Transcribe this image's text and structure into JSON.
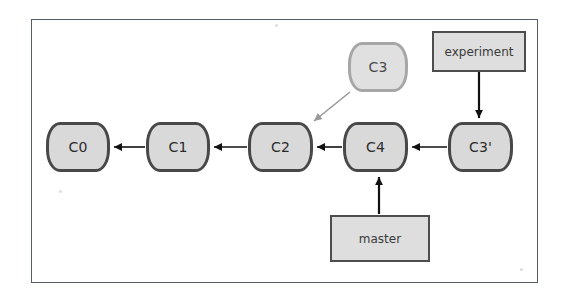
{
  "figure": {
    "frame_color": "#555c63",
    "background": "#ffffff"
  },
  "palette": {
    "node_fill": "#d9d9d9",
    "node_border": "#484848",
    "node_border_faded": "#a6a6a6",
    "label_fill": "#dedede",
    "label_border": "#4d4d4d",
    "arrow_color": "#111111",
    "arrow_color_faded": "#9a9a9a",
    "text_color": "#2b2b2b"
  },
  "commits": [
    {
      "id": "c0",
      "label": "C0",
      "x": 46,
      "y": 122,
      "w": 64,
      "h": 50,
      "faded": false
    },
    {
      "id": "c1",
      "label": "C1",
      "x": 146,
      "y": 122,
      "w": 64,
      "h": 50,
      "faded": false
    },
    {
      "id": "c2",
      "label": "C2",
      "x": 248,
      "y": 122,
      "w": 65,
      "h": 50,
      "faded": false
    },
    {
      "id": "c4",
      "label": "C4",
      "x": 343,
      "y": 122,
      "w": 65,
      "h": 50,
      "faded": false
    },
    {
      "id": "c3p",
      "label": "C3'",
      "x": 448,
      "y": 122,
      "w": 65,
      "h": 50,
      "faded": false
    },
    {
      "id": "c3",
      "label": "C3",
      "x": 348,
      "y": 42,
      "w": 60,
      "h": 50,
      "faded": true
    }
  ],
  "branch_labels": [
    {
      "id": "experiment",
      "label": "experiment",
      "x": 432,
      "y": 31,
      "w": 94,
      "h": 41
    },
    {
      "id": "master",
      "label": "master",
      "x": 330,
      "y": 215,
      "w": 100,
      "h": 47
    }
  ],
  "arrows": [
    {
      "id": "c1-to-c0",
      "from": "C1",
      "to": "C0",
      "style": "solid-dark",
      "direction": "left"
    },
    {
      "id": "c2-to-c1",
      "from": "C2",
      "to": "C1",
      "style": "solid-dark",
      "direction": "left"
    },
    {
      "id": "c4-to-c2",
      "from": "C4",
      "to": "C2",
      "style": "solid-dark",
      "direction": "left"
    },
    {
      "id": "c3prime-to-c4",
      "from": "C3'",
      "to": "C4",
      "style": "solid-dark",
      "direction": "left"
    },
    {
      "id": "c3-to-c2",
      "from": "C3",
      "to": "C2",
      "style": "solid-light",
      "direction": "down-left"
    },
    {
      "id": "experiment-to-c3prime",
      "from": "experiment",
      "to": "C3'",
      "style": "solid-dark",
      "direction": "down"
    },
    {
      "id": "master-to-c4",
      "from": "master",
      "to": "C4",
      "style": "solid-dark",
      "direction": "up"
    }
  ]
}
